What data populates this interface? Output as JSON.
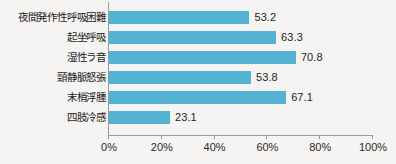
{
  "chart_data": {
    "type": "bar",
    "orientation": "horizontal",
    "title": "",
    "xlabel": "",
    "ylabel": "",
    "xlim": [
      0,
      100
    ],
    "grid": false,
    "legend": false,
    "bar_color": "#54b3d2",
    "axis_color": "#9a9a9a",
    "background_color": "#f5f4f2",
    "categories": [
      "夜間発作性呼吸困難",
      "起坐呼吸",
      "湿性ラ音",
      "頸静脈怒張",
      "末梢浮腫",
      "四肢冷感"
    ],
    "values": [
      53.2,
      63.3,
      70.8,
      53.8,
      67.1,
      23.1
    ],
    "value_labels": [
      "53.2",
      "63.3",
      "70.8",
      "53.8",
      "67.1",
      "23.1"
    ],
    "tick_values": [
      0,
      20,
      40,
      60,
      80,
      100
    ],
    "tick_labels": [
      "0%",
      "20%",
      "40%",
      "60%",
      "80%",
      "100%"
    ]
  },
  "caption": {
    "text": ""
  }
}
